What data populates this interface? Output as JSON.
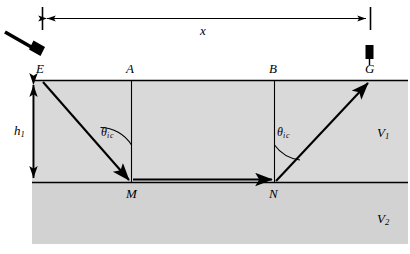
{
  "figure": {
    "type": "seismic-refraction-raypath-diagram",
    "title": "",
    "background_color": "#ffffff",
    "layer_fill_color": "#d6d6d6",
    "line_color": "#000000"
  },
  "dimension": {
    "label": "x",
    "arrow_style": "double-headed",
    "left_tick_x": 42,
    "right_tick_x": 370,
    "y": 18
  },
  "source": {
    "icon_name": "hammer-icon",
    "label": ""
  },
  "receiver": {
    "icon_name": "geophone-icon",
    "label": ""
  },
  "surface_points": [
    {
      "label": "E",
      "x": 42
    },
    {
      "label": "A",
      "x": 131
    },
    {
      "label": "B",
      "x": 274
    },
    {
      "label": "G",
      "x": 370
    }
  ],
  "interface_points": [
    {
      "label": "M",
      "x": 131
    },
    {
      "label": "N",
      "x": 274
    }
  ],
  "depth": {
    "label_base": "h",
    "label_sub": "1"
  },
  "angles": [
    {
      "symbol": "θ",
      "sub_i": "i",
      "sub_c": "c",
      "at": "M"
    },
    {
      "symbol": "θ",
      "sub_i": "i",
      "sub_c": "c",
      "at": "N"
    }
  ],
  "velocities": [
    {
      "base": "V",
      "sub": "1",
      "layer": "upper"
    },
    {
      "base": "V",
      "sub": "2",
      "layer": "lower"
    }
  ],
  "geometry": {
    "surface_y": 80,
    "interface_y": 182,
    "bottom_y": 244,
    "left_x": 32,
    "right_x": 408
  }
}
